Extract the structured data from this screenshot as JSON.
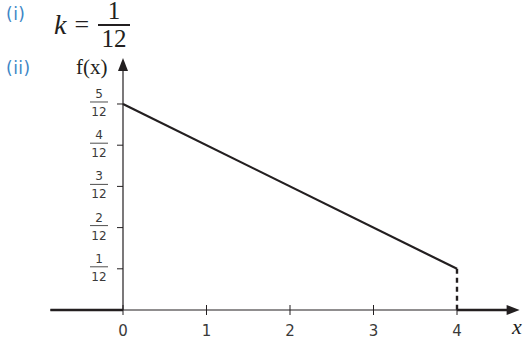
{
  "parts": [
    {
      "label": "(i)"
    },
    {
      "label": "(ii)"
    }
  ],
  "answer_i": {
    "variable": "k",
    "equals": "=",
    "numerator": "1",
    "denominator": "12"
  },
  "chart_data": {
    "type": "line",
    "title": "",
    "xlabel": "x",
    "ylabel": "f(x)",
    "xlim": [
      -0.87,
      4.75
    ],
    "ylim": [
      0,
      0.5
    ],
    "x_ticks": [
      0,
      1,
      2,
      3,
      4
    ],
    "x_tick_labels": [
      "0",
      "1",
      "2",
      "3",
      "4"
    ],
    "y_ticks": [
      0.08333,
      0.16667,
      0.25,
      0.33333,
      0.41667
    ],
    "y_tick_labels": [
      {
        "num": "1",
        "den": "12"
      },
      {
        "num": "2",
        "den": "12"
      },
      {
        "num": "3",
        "den": "12"
      },
      {
        "num": "4",
        "den": "12"
      },
      {
        "num": "5",
        "den": "12"
      }
    ],
    "grid": false,
    "series": [
      {
        "name": "f(x) zero for x<0",
        "style": "solid-thick",
        "x": [
          -0.87,
          0
        ],
        "y": [
          0,
          0
        ]
      },
      {
        "name": "f(x) on 0<=x<=4",
        "style": "solid",
        "x": [
          0,
          4
        ],
        "y": [
          0.41667,
          0.08333
        ]
      },
      {
        "name": "drop at x=4",
        "style": "dashed",
        "x": [
          4,
          4
        ],
        "y": [
          0.08333,
          0
        ]
      },
      {
        "name": "f(x) zero for x>4",
        "style": "solid-thick",
        "x": [
          4,
          4.75
        ],
        "y": [
          0,
          0
        ]
      }
    ]
  }
}
